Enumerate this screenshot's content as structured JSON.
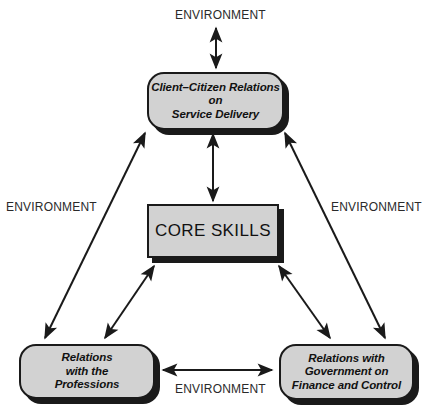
{
  "diagram": {
    "type": "relationship-diagram",
    "palette": {
      "box_fill": "#d2d2d2",
      "box_stroke": "#1a1a1a",
      "shadow": "#1a1a1a",
      "background": "#ffffff",
      "text": "#111111"
    },
    "nodes": {
      "center": {
        "id": "core-skills",
        "label": "CORE SKILLS",
        "shape": "rectangle",
        "style": "uppercase-roman"
      },
      "top": {
        "id": "client-citizen-relations",
        "label": "Client–Citizen Relations\non\nService Delivery",
        "lines": [
          "Client–Citizen Relations",
          "on",
          "Service Delivery"
        ],
        "shape": "rounded-rectangle",
        "style": "italic"
      },
      "bottom_left": {
        "id": "relations-with-professions",
        "label": "Relations\nwith the\nProfessions",
        "lines": [
          "Relations",
          "with the",
          "Professions"
        ],
        "shape": "rounded-rectangle",
        "style": "italic"
      },
      "bottom_right": {
        "id": "relations-with-government",
        "label": "Relations with\nGovernment on\nFinance and Control",
        "lines": [
          "Relations with",
          "Government on",
          "Finance and Control"
        ],
        "shape": "rounded-rectangle",
        "style": "italic"
      }
    },
    "environment_labels": {
      "top": "ENVIRONMENT",
      "left": "ENVIRONMENT",
      "right": "ENVIRONMENT",
      "bottom": "ENVIRONMENT"
    },
    "connections": [
      {
        "id": "top-environment",
        "from": "environment-top",
        "to": "client-citizen-relations",
        "arrow": "double"
      },
      {
        "id": "core-to-top",
        "from": "core-skills",
        "to": "client-citizen-relations",
        "arrow": "double"
      },
      {
        "id": "core-to-bottom-left",
        "from": "core-skills",
        "to": "relations-with-professions",
        "arrow": "double"
      },
      {
        "id": "core-to-bottom-right",
        "from": "core-skills",
        "to": "relations-with-government",
        "arrow": "double"
      },
      {
        "id": "top-to-bottom-left",
        "from": "client-citizen-relations",
        "to": "relations-with-professions",
        "arrow": "double"
      },
      {
        "id": "top-to-bottom-right",
        "from": "client-citizen-relations",
        "to": "relations-with-government",
        "arrow": "double"
      },
      {
        "id": "bottom-left-to-bottom-right",
        "from": "relations-with-professions",
        "to": "relations-with-government",
        "arrow": "double"
      }
    ]
  }
}
